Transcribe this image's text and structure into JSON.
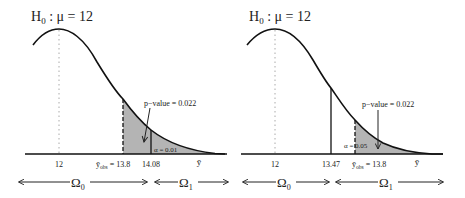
{
  "panels": [
    {
      "title": "H₀ : μ = 12",
      "title_main": "H",
      "title_sub": "0",
      "title_rest": " : μ = 12",
      "mean_label": "12",
      "obs_label_main": "ȳ",
      "obs_label_sub": "obs",
      "obs_label_rest": " = 13.8",
      "critical_label": "14.08",
      "ybar_label": "ȳ",
      "pvalue_label": "p−value = 0.022",
      "alpha_label": "α = 0.01",
      "omega0_main": "Ω",
      "omega0_sub": "0",
      "omega1_main": "Ω",
      "omega1_sub": "1"
    },
    {
      "title": "H₀ : μ = 12",
      "title_main": "H",
      "title_sub": "0",
      "title_rest": " : μ = 12",
      "mean_label": "12",
      "critical_label": "13.47",
      "obs_label_main": "ȳ",
      "obs_label_sub": "obs",
      "obs_label_rest": " = 13.8",
      "ybar_label": "ȳ",
      "pvalue_label": "p−value = 0.022",
      "alpha_label": "α = 0.05",
      "omega0_main": "Ω",
      "omega0_sub": "0",
      "omega1_main": "Ω",
      "omega1_sub": "1"
    }
  ],
  "colors": {
    "curve": "#111111",
    "shade": "#b4b4b4",
    "text": "#222222",
    "dotted": "#aaaaaa"
  }
}
